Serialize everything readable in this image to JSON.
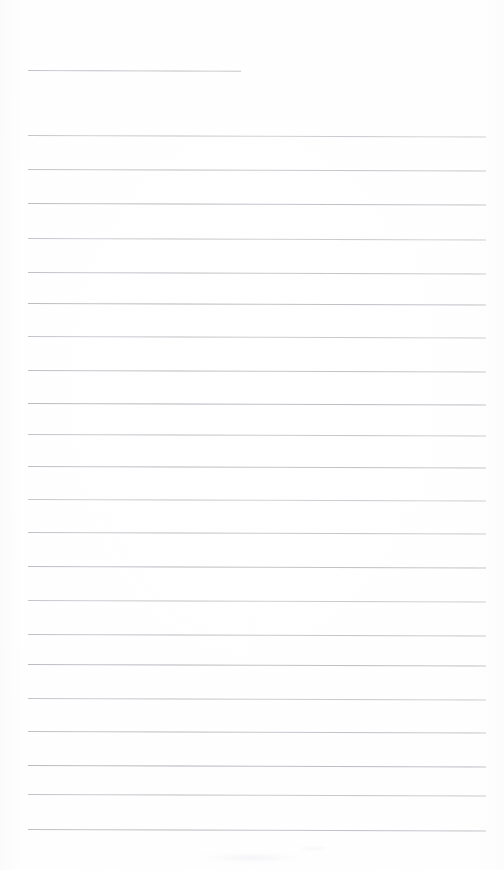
{
  "page": {
    "kind": "scanned-lined-paper",
    "width_px": 504,
    "height_px": 870,
    "background_color": "#fefefe",
    "content_text": "",
    "is_blank": true
  },
  "rule_style": {
    "color": "#b0b0b8",
    "thickness_px": 1,
    "left_margin_px": 28,
    "right_edge_px": 486,
    "skew_deg": 0.18
  },
  "header_rule": {
    "label": "header-rule",
    "y": 70,
    "x_start": 28,
    "x_end": 241,
    "width_px": 213,
    "color": "#b6b6be"
  },
  "body_rules": {
    "count": 21,
    "first_y": 135,
    "spacing_px": 34.7,
    "x_start": 28,
    "x_end": 486,
    "width_px": 458,
    "lines": [
      {
        "index": 1,
        "y": 135,
        "content": ""
      },
      {
        "index": 2,
        "y": 169,
        "content": ""
      },
      {
        "index": 3,
        "y": 203,
        "content": ""
      },
      {
        "index": 4,
        "y": 238,
        "content": ""
      },
      {
        "index": 5,
        "y": 272,
        "content": ""
      },
      {
        "index": 6,
        "y": 303,
        "content": ""
      },
      {
        "index": 7,
        "y": 336,
        "content": ""
      },
      {
        "index": 8,
        "y": 370,
        "content": ""
      },
      {
        "index": 9,
        "y": 403,
        "content": ""
      },
      {
        "index": 10,
        "y": 434,
        "content": ""
      },
      {
        "index": 11,
        "y": 466,
        "content": ""
      },
      {
        "index": 12,
        "y": 499,
        "content": ""
      },
      {
        "index": 13,
        "y": 532,
        "content": ""
      },
      {
        "index": 14,
        "y": 566,
        "content": ""
      },
      {
        "index": 15,
        "y": 600,
        "content": ""
      },
      {
        "index": 16,
        "y": 634,
        "content": ""
      },
      {
        "index": 17,
        "y": 664,
        "content": ""
      },
      {
        "index": 18,
        "y": 698,
        "content": ""
      },
      {
        "index": 19,
        "y": 731,
        "content": ""
      },
      {
        "index": 20,
        "y": 765,
        "content": ""
      },
      {
        "index": 21,
        "y": 794,
        "content": ""
      },
      {
        "index": 22,
        "y": 829,
        "content": ""
      }
    ]
  },
  "artifacts": {
    "smudge_label": "scan-smudge",
    "speck_label": "scan-speck"
  }
}
